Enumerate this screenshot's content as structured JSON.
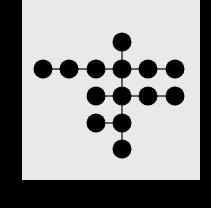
{
  "diagram": {
    "background_color": "#000000",
    "panel_color": "#e9e9e9",
    "node_color": "#000000",
    "edge_color": "#333333",
    "node_radius": 9.5,
    "nodes": [
      {
        "id": "n1",
        "x": 122,
        "y": 42
      },
      {
        "id": "n2",
        "x": 43,
        "y": 69
      },
      {
        "id": "n3",
        "x": 69,
        "y": 69
      },
      {
        "id": "n4",
        "x": 96,
        "y": 69
      },
      {
        "id": "n5",
        "x": 122,
        "y": 69
      },
      {
        "id": "n6",
        "x": 148,
        "y": 69
      },
      {
        "id": "n7",
        "x": 175,
        "y": 69
      },
      {
        "id": "n8",
        "x": 96,
        "y": 96
      },
      {
        "id": "n9",
        "x": 122,
        "y": 96
      },
      {
        "id": "n10",
        "x": 148,
        "y": 96
      },
      {
        "id": "n11",
        "x": 175,
        "y": 96
      },
      {
        "id": "n12",
        "x": 96,
        "y": 123
      },
      {
        "id": "n13",
        "x": 122,
        "y": 123
      },
      {
        "id": "n14",
        "x": 122,
        "y": 149
      }
    ],
    "edges": [
      [
        "n1",
        "n5"
      ],
      [
        "n2",
        "n3"
      ],
      [
        "n3",
        "n4"
      ],
      [
        "n4",
        "n5"
      ],
      [
        "n5",
        "n6"
      ],
      [
        "n6",
        "n7"
      ],
      [
        "n5",
        "n9"
      ],
      [
        "n8",
        "n9"
      ],
      [
        "n9",
        "n10"
      ],
      [
        "n10",
        "n11"
      ],
      [
        "n9",
        "n13"
      ],
      [
        "n12",
        "n13"
      ],
      [
        "n13",
        "n14"
      ]
    ]
  }
}
